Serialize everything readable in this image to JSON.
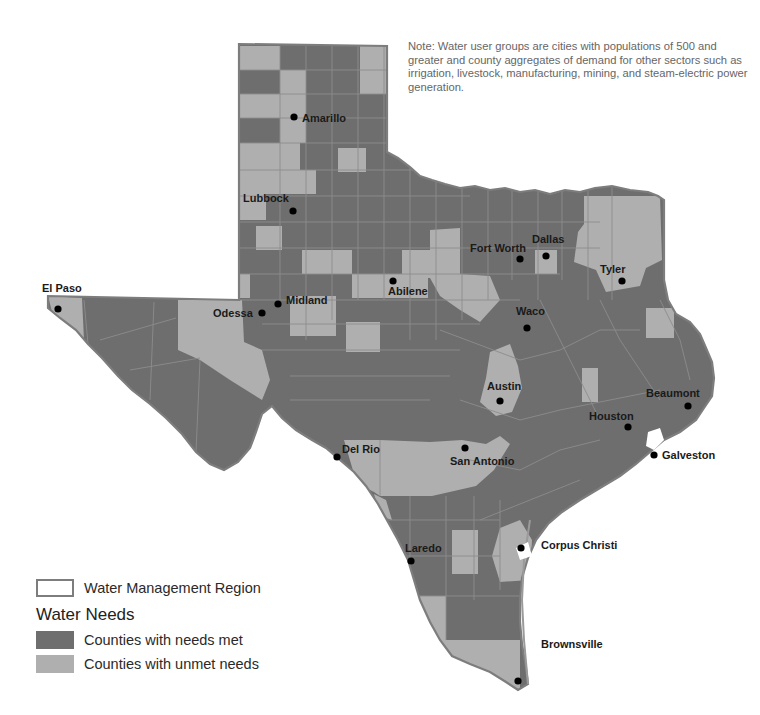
{
  "note": {
    "text": "Note: Water user groups are cities with populations of 500 and greater and county aggregates of demand for other sectors such as irrigation, livestock, manufacturing, mining, and steam-electric power generation."
  },
  "colors": {
    "needs_met": "#6e6e6e",
    "unmet_needs": "#afafaf",
    "county_border": "#8c8c8c",
    "region_border": "#7d7d7d",
    "city_dot": "#000000"
  },
  "cities": [
    {
      "name": "Amarillo",
      "x": 294,
      "y": 117
    },
    {
      "name": "Lubbock",
      "x": 293,
      "y": 211
    },
    {
      "name": "El Paso",
      "x": 58,
      "y": 309
    },
    {
      "name": "Midland",
      "x": 278,
      "y": 304
    },
    {
      "name": "Odessa",
      "x": 262,
      "y": 313
    },
    {
      "name": "Abilene",
      "x": 393,
      "y": 281
    },
    {
      "name": "Fort Worth",
      "x": 520,
      "y": 259
    },
    {
      "name": "Dallas",
      "x": 546,
      "y": 256
    },
    {
      "name": "Tyler",
      "x": 622,
      "y": 281
    },
    {
      "name": "Waco",
      "x": 527,
      "y": 328
    },
    {
      "name": "Austin",
      "x": 500,
      "y": 401
    },
    {
      "name": "Beaumont",
      "x": 688,
      "y": 406
    },
    {
      "name": "Houston",
      "x": 628,
      "y": 427
    },
    {
      "name": "Galveston",
      "x": 654,
      "y": 455
    },
    {
      "name": "San Antonio",
      "x": 465,
      "y": 448
    },
    {
      "name": "Del Rio",
      "x": 337,
      "y": 457
    },
    {
      "name": "Corpus Christi",
      "x": 521,
      "y": 548
    },
    {
      "name": "Laredo",
      "x": 411,
      "y": 561
    },
    {
      "name": "Brownsville",
      "x": 518,
      "y": 681
    }
  ],
  "legend": {
    "region_label": "Water Management Region",
    "heading": "Water Needs",
    "met_label": "Counties with needs met",
    "unmet_label": "Counties with unmet needs"
  }
}
